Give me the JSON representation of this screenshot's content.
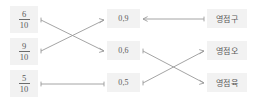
{
  "exercise": {
    "type": "matching-lines",
    "columns": {
      "fractions": {
        "name": "fraction-column",
        "items": [
          {
            "numerator": "6",
            "denominator": "10",
            "value": "6/10"
          },
          {
            "numerator": "9",
            "denominator": "10",
            "value": "9/10"
          },
          {
            "numerator": "5",
            "denominator": "10",
            "value": "5/10"
          }
        ]
      },
      "decimals": {
        "name": "decimal-column",
        "items": [
          {
            "value": "0,9"
          },
          {
            "value": "0,6"
          },
          {
            "value": "0,5"
          }
        ]
      },
      "words": {
        "name": "word-column",
        "items": [
          {
            "value": "영점구"
          },
          {
            "value": "영점오"
          },
          {
            "value": "영점육"
          }
        ]
      }
    },
    "connections": {
      "left_group": [
        {
          "from": "fraction-0",
          "to": "decimal-1"
        },
        {
          "from": "fraction-1",
          "to": "decimal-0"
        },
        {
          "from": "fraction-2",
          "to": "decimal-2"
        }
      ],
      "right_group": [
        {
          "from": "decimal-0",
          "to": "word-0"
        },
        {
          "from": "decimal-1",
          "to": "word-2"
        },
        {
          "from": "decimal-2",
          "to": "word-1"
        }
      ]
    }
  },
  "colors": {
    "cell_background": "#f2f2f2",
    "text": "#5a5a5a",
    "line": "#9a9a9a",
    "page_background": "#ffffff"
  }
}
